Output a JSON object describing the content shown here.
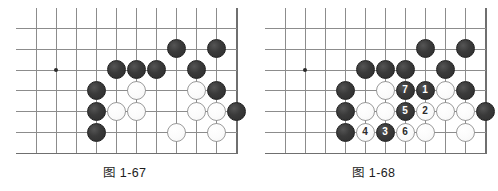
{
  "page": {
    "background_color": "#ffffff",
    "figure_count": 2
  },
  "board_geometry": {
    "origin_x": 20,
    "origin_y": 20,
    "cell_w": 20,
    "cell_h": 20.8,
    "cols": 11,
    "rows": 7,
    "line_color": "#8c8c8c",
    "edge_color": "#6f6f6f",
    "stone_diameter": 19
  },
  "colors": {
    "black_stone": "#2d2d2d",
    "white_stone": "#fbfbfb",
    "white_stone_border": "#9a9a9a",
    "grid": "#8c8c8c",
    "text": "#1c1c1c"
  },
  "figures": [
    {
      "id": "figure-1-67",
      "caption": "图 1-67",
      "star_points": [
        {
          "col": 2,
          "row": 3
        },
        {
          "col": 7,
          "row": 3
        }
      ],
      "stones": [
        {
          "color": "black",
          "col": 5,
          "row": 3,
          "label": ""
        },
        {
          "color": "black",
          "col": 6,
          "row": 3,
          "label": ""
        },
        {
          "color": "black",
          "col": 7,
          "row": 3,
          "label": ""
        },
        {
          "color": "black",
          "col": 8,
          "row": 2,
          "label": ""
        },
        {
          "color": "black",
          "col": 10,
          "row": 2,
          "label": ""
        },
        {
          "color": "black",
          "col": 9,
          "row": 3,
          "label": ""
        },
        {
          "color": "black",
          "col": 4,
          "row": 4,
          "label": ""
        },
        {
          "color": "black",
          "col": 10,
          "row": 4,
          "label": ""
        },
        {
          "color": "black",
          "col": 4,
          "row": 5,
          "label": ""
        },
        {
          "color": "black",
          "col": 11,
          "row": 5,
          "label": ""
        },
        {
          "color": "black",
          "col": 4,
          "row": 6,
          "label": ""
        },
        {
          "color": "white",
          "col": 6,
          "row": 4,
          "label": ""
        },
        {
          "color": "white",
          "col": 9,
          "row": 4,
          "label": ""
        },
        {
          "color": "white",
          "col": 5,
          "row": 5,
          "label": ""
        },
        {
          "color": "white",
          "col": 6,
          "row": 5,
          "label": ""
        },
        {
          "color": "white",
          "col": 9,
          "row": 5,
          "label": ""
        },
        {
          "color": "white",
          "col": 10,
          "row": 5,
          "label": ""
        },
        {
          "color": "white",
          "col": 8,
          "row": 6,
          "label": ""
        },
        {
          "color": "white",
          "col": 10,
          "row": 6,
          "label": ""
        }
      ]
    },
    {
      "id": "figure-1-68",
      "caption": "图 1-68",
      "star_points": [
        {
          "col": 2,
          "row": 3
        },
        {
          "col": 7,
          "row": 3
        }
      ],
      "stones": [
        {
          "color": "black",
          "col": 5,
          "row": 3,
          "label": ""
        },
        {
          "color": "black",
          "col": 6,
          "row": 3,
          "label": ""
        },
        {
          "color": "black",
          "col": 7,
          "row": 3,
          "label": ""
        },
        {
          "color": "black",
          "col": 8,
          "row": 2,
          "label": ""
        },
        {
          "color": "black",
          "col": 10,
          "row": 2,
          "label": ""
        },
        {
          "color": "black",
          "col": 9,
          "row": 3,
          "label": ""
        },
        {
          "color": "black",
          "col": 4,
          "row": 4,
          "label": ""
        },
        {
          "color": "black",
          "col": 10,
          "row": 4,
          "label": ""
        },
        {
          "color": "black",
          "col": 4,
          "row": 5,
          "label": ""
        },
        {
          "color": "black",
          "col": 11,
          "row": 5,
          "label": ""
        },
        {
          "color": "black",
          "col": 4,
          "row": 6,
          "label": ""
        },
        {
          "color": "black",
          "col": 7,
          "row": 4,
          "label": "7"
        },
        {
          "color": "black",
          "col": 8,
          "row": 4,
          "label": "1"
        },
        {
          "color": "black",
          "col": 7,
          "row": 5,
          "label": "5"
        },
        {
          "color": "black",
          "col": 6,
          "row": 6,
          "label": "3"
        },
        {
          "color": "white",
          "col": 6,
          "row": 4,
          "label": ""
        },
        {
          "color": "white",
          "col": 9,
          "row": 4,
          "label": ""
        },
        {
          "color": "white",
          "col": 5,
          "row": 5,
          "label": ""
        },
        {
          "color": "white",
          "col": 6,
          "row": 5,
          "label": ""
        },
        {
          "color": "white",
          "col": 9,
          "row": 5,
          "label": ""
        },
        {
          "color": "white",
          "col": 10,
          "row": 5,
          "label": ""
        },
        {
          "color": "white",
          "col": 8,
          "row": 6,
          "label": ""
        },
        {
          "color": "white",
          "col": 10,
          "row": 6,
          "label": ""
        },
        {
          "color": "white",
          "col": 8,
          "row": 5,
          "label": "2"
        },
        {
          "color": "white",
          "col": 5,
          "row": 6,
          "label": "4"
        },
        {
          "color": "white",
          "col": 7,
          "row": 6,
          "label": "6"
        }
      ]
    }
  ]
}
